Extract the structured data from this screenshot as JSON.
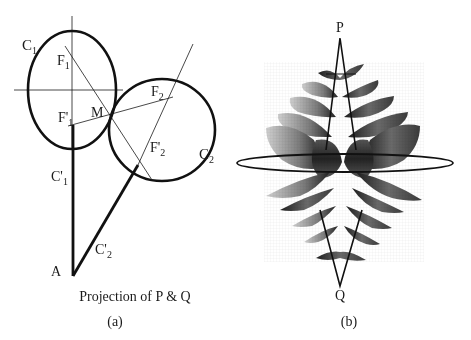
{
  "figure": {
    "panel_a": {
      "labels": {
        "C1": "C",
        "C1_sub": "1",
        "F1": "F",
        "F1_sub": "1",
        "F1p": "F'",
        "F1p_sub": "1",
        "M": "M",
        "F2": "F",
        "F2_sub": "2",
        "F2p": "F'",
        "F2p_sub": "2",
        "C2": "C",
        "C2_sub": "2",
        "C1p": "C'",
        "C1p_sub": "1",
        "C2p": "C'",
        "C2p_sub": "2",
        "A": "A"
      },
      "caption": "Projection of P & Q",
      "tag": "(a)"
    },
    "panel_b": {
      "labels": {
        "P": "P",
        "Q": "Q"
      },
      "tag": "(b)"
    },
    "colors": {
      "ink": "#1a1a1a",
      "surface_dark": "#2a2a2a",
      "surface_mid": "#6e6e6e",
      "surface_light": "#b8b8b8",
      "background": "#ffffff"
    }
  }
}
